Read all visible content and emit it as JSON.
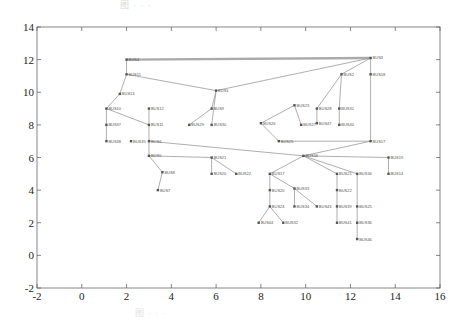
{
  "figure": {
    "caption_top": "图 · · ·",
    "caption_bottom": "图 · · ·"
  },
  "axes": {
    "xlim": [
      -2,
      16
    ],
    "ylim": [
      -2,
      14
    ],
    "x_ticks": [
      "-2",
      "0",
      "2",
      "4",
      "6",
      "8",
      "10",
      "12",
      "14",
      "16"
    ],
    "x_tick_values": [
      -2,
      0,
      2,
      4,
      6,
      8,
      10,
      12,
      14,
      16
    ],
    "y_ticks": [
      "-2",
      "0",
      "2",
      "4",
      "6",
      "8",
      "10",
      "12",
      "14"
    ],
    "y_tick_values": [
      -2,
      0,
      2,
      4,
      6,
      8,
      10,
      12,
      14
    ],
    "frame": {
      "left": 37,
      "top": 27,
      "right": 440,
      "bottom": 288
    }
  },
  "graph": {
    "nodes": [
      {
        "id": "n1",
        "label": "BUS4",
        "x": 2.0,
        "y": 12.0
      },
      {
        "id": "n2",
        "label": "BUS3",
        "x": 12.9,
        "y": 12.1
      },
      {
        "id": "n3",
        "label": "BUS11",
        "x": 2.0,
        "y": 11.1
      },
      {
        "id": "n4",
        "label": "BUS13",
        "x": 1.7,
        "y": 9.9
      },
      {
        "id": "n5",
        "label": "BUS1",
        "x": 6.0,
        "y": 10.1
      },
      {
        "id": "n6",
        "label": "BUS2",
        "x": 11.6,
        "y": 11.1
      },
      {
        "id": "n7",
        "label": "BUS18",
        "x": 12.9,
        "y": 11.1
      },
      {
        "id": "n8",
        "label": "BUS10",
        "x": 1.1,
        "y": 9.0
      },
      {
        "id": "n9",
        "label": "BUS12",
        "x": 3.0,
        "y": 9.0
      },
      {
        "id": "n10",
        "label": "BUS37",
        "x": 1.1,
        "y": 8.0
      },
      {
        "id": "n11",
        "label": "BUS11",
        "x": 3.0,
        "y": 8.0
      },
      {
        "id": "n12",
        "label": "BUS38",
        "x": 1.1,
        "y": 7.0
      },
      {
        "id": "n13",
        "label": "BUS35",
        "x": 2.2,
        "y": 7.0
      },
      {
        "id": "n14",
        "label": "BUS6",
        "x": 3.0,
        "y": 7.0
      },
      {
        "id": "n15",
        "label": "BUS5",
        "x": 3.0,
        "y": 6.1
      },
      {
        "id": "n16",
        "label": "BUS8",
        "x": 3.6,
        "y": 5.1
      },
      {
        "id": "n17",
        "label": "BUS7",
        "x": 3.4,
        "y": 4.0
      },
      {
        "id": "n18",
        "label": "BUS9",
        "x": 5.8,
        "y": 9.0
      },
      {
        "id": "n19",
        "label": "BUS29",
        "x": 4.8,
        "y": 8.0
      },
      {
        "id": "n20",
        "label": "BUS30",
        "x": 5.8,
        "y": 8.0
      },
      {
        "id": "n21",
        "label": "BUS23",
        "x": 9.5,
        "y": 9.2
      },
      {
        "id": "n22",
        "label": "BUS27",
        "x": 9.8,
        "y": 8.0
      },
      {
        "id": "n23",
        "label": "BUS26",
        "x": 8.0,
        "y": 8.1
      },
      {
        "id": "n24",
        "label": "BUS28",
        "x": 10.5,
        "y": 9.0
      },
      {
        "id": "n25",
        "label": "BUS31",
        "x": 11.5,
        "y": 9.0
      },
      {
        "id": "n26",
        "label": "BUS47",
        "x": 10.5,
        "y": 8.1
      },
      {
        "id": "n27",
        "label": "BUS40",
        "x": 11.5,
        "y": 8.0
      },
      {
        "id": "n28",
        "label": "BUS25",
        "x": 8.8,
        "y": 7.0
      },
      {
        "id": "n29",
        "label": "BUS17",
        "x": 12.9,
        "y": 7.0
      },
      {
        "id": "n30",
        "label": "BUS16",
        "x": 9.9,
        "y": 6.1
      },
      {
        "id": "n31",
        "label": "BUS19",
        "x": 13.7,
        "y": 6.0
      },
      {
        "id": "n32",
        "label": "BUS14",
        "x": 13.7,
        "y": 5.0
      },
      {
        "id": "n33",
        "label": "BUS21",
        "x": 5.8,
        "y": 6.0
      },
      {
        "id": "n34",
        "label": "BUS20",
        "x": 5.8,
        "y": 5.0
      },
      {
        "id": "n35",
        "label": "BUS22",
        "x": 6.9,
        "y": 5.0
      },
      {
        "id": "n36",
        "label": "BUS17",
        "x": 8.4,
        "y": 5.0
      },
      {
        "id": "n37",
        "label": "BUS20",
        "x": 8.4,
        "y": 4.0
      },
      {
        "id": "n38",
        "label": "BUS24",
        "x": 8.4,
        "y": 3.0
      },
      {
        "id": "n39",
        "label": "BUS44",
        "x": 7.9,
        "y": 2.0
      },
      {
        "id": "n40",
        "label": "BUS32",
        "x": 9.0,
        "y": 2.0
      },
      {
        "id": "n41",
        "label": "BUS33",
        "x": 9.5,
        "y": 4.1
      },
      {
        "id": "n42",
        "label": "BUS34",
        "x": 9.5,
        "y": 3.0
      },
      {
        "id": "n43",
        "label": "BUS43",
        "x": 10.5,
        "y": 3.0
      },
      {
        "id": "n44",
        "label": "BUS21",
        "x": 11.4,
        "y": 5.0
      },
      {
        "id": "n45",
        "label": "BUS22",
        "x": 11.4,
        "y": 4.0
      },
      {
        "id": "n46",
        "label": "BUS39",
        "x": 11.4,
        "y": 3.0
      },
      {
        "id": "n47",
        "label": "BUS41",
        "x": 11.4,
        "y": 2.0
      },
      {
        "id": "n48",
        "label": "BUS34",
        "x": 12.3,
        "y": 5.0
      },
      {
        "id": "n49",
        "label": "BUS25",
        "x": 12.3,
        "y": 3.0
      },
      {
        "id": "n50",
        "label": "BUS36",
        "x": 12.3,
        "y": 2.0
      },
      {
        "id": "n51",
        "label": "BUS46",
        "x": 12.3,
        "y": 1.0
      }
    ],
    "thick_edges": [
      [
        "n1",
        "n2"
      ]
    ],
    "edges": [
      [
        "n1",
        "n3"
      ],
      [
        "n3",
        "n4"
      ],
      [
        "n3",
        "n5"
      ],
      [
        "n4",
        "n8"
      ],
      [
        "n8",
        "n10"
      ],
      [
        "n10",
        "n12"
      ],
      [
        "n8",
        "n11"
      ],
      [
        "n9",
        "n11"
      ],
      [
        "n11",
        "n14"
      ],
      [
        "n14",
        "n15"
      ],
      [
        "n15",
        "n16"
      ],
      [
        "n16",
        "n17"
      ],
      [
        "n5",
        "n18"
      ],
      [
        "n18",
        "n19"
      ],
      [
        "n5",
        "n20"
      ],
      [
        "n2",
        "n6"
      ],
      [
        "n2",
        "n7"
      ],
      [
        "n7",
        "n29"
      ],
      [
        "n6",
        "n24"
      ],
      [
        "n6",
        "n25"
      ],
      [
        "n24",
        "n26"
      ],
      [
        "n25",
        "n27"
      ],
      [
        "n21",
        "n22"
      ],
      [
        "n21",
        "n23"
      ],
      [
        "n23",
        "n28"
      ],
      [
        "n28",
        "n29"
      ],
      [
        "n29",
        "n30"
      ],
      [
        "n30",
        "n31"
      ],
      [
        "n31",
        "n32"
      ],
      [
        "n30",
        "n36"
      ],
      [
        "n30",
        "n44"
      ],
      [
        "n30",
        "n48"
      ],
      [
        "n36",
        "n37"
      ],
      [
        "n37",
        "n38"
      ],
      [
        "n38",
        "n39"
      ],
      [
        "n38",
        "n40"
      ],
      [
        "n36",
        "n41"
      ],
      [
        "n41",
        "n42"
      ],
      [
        "n41",
        "n43"
      ],
      [
        "n44",
        "n45"
      ],
      [
        "n45",
        "n46"
      ],
      [
        "n46",
        "n47"
      ],
      [
        "n48",
        "n49"
      ],
      [
        "n49",
        "n50"
      ],
      [
        "n50",
        "n51"
      ],
      [
        "n33",
        "n34"
      ],
      [
        "n33",
        "n35"
      ],
      [
        "n5",
        "n2"
      ],
      [
        "n14",
        "n30"
      ],
      [
        "n15",
        "n33"
      ]
    ]
  }
}
